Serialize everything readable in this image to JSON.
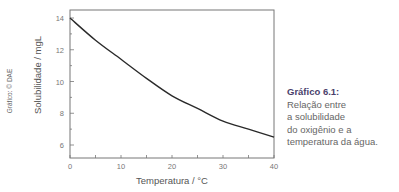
{
  "credit": "Gráfico: © DAE",
  "caption": {
    "title": "Gráfico 6.1:",
    "lines": [
      "Relação entre",
      "a solubilidade",
      "do oxigênio e a",
      "temperatura da água."
    ]
  },
  "chart_data": {
    "type": "line",
    "title": "",
    "xlabel": "Temperatura / °C",
    "ylabel": "Solubilidade / mgL",
    "xlim": [
      0,
      40
    ],
    "ylim": [
      5,
      14.5
    ],
    "x_ticks": [
      0,
      10,
      20,
      30,
      40
    ],
    "y_ticks": [
      6,
      8,
      10,
      12,
      14
    ],
    "grid": false,
    "series": [
      {
        "name": "Solubilidade do O2",
        "x": [
          0,
          5,
          10,
          15,
          20,
          25,
          30,
          35,
          40
        ],
        "values": [
          14.0,
          12.6,
          11.4,
          10.2,
          9.1,
          8.3,
          7.5,
          7.0,
          6.5
        ]
      }
    ],
    "line_color": "#2a2a2a"
  }
}
